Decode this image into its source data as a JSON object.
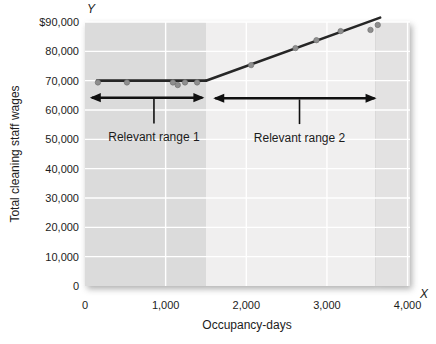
{
  "chart_data": {
    "type": "scatter",
    "title": "",
    "xlabel": "Occupancy-days",
    "ylabel": "Total cleaning staff wages",
    "x_axis_letter": "X",
    "y_axis_letter": "Y",
    "xlim": [
      0,
      4030
    ],
    "ylim": [
      0,
      90000
    ],
    "grid": true,
    "legend": "none",
    "x_ticks": [
      {
        "value": 0,
        "label": "0"
      },
      {
        "value": 1000,
        "label": "1,000"
      },
      {
        "value": 2000,
        "label": "2,000"
      },
      {
        "value": 3000,
        "label": "3,000"
      },
      {
        "value": 4000,
        "label": "4,000"
      }
    ],
    "y_ticks": [
      {
        "value": 0,
        "label": "0"
      },
      {
        "value": 10000,
        "label": "10,000"
      },
      {
        "value": 20000,
        "label": "20,000"
      },
      {
        "value": 30000,
        "label": "30,000"
      },
      {
        "value": 40000,
        "label": "40,000"
      },
      {
        "value": 50000,
        "label": "50,000"
      },
      {
        "value": 60000,
        "label": "60,000"
      },
      {
        "value": 70000,
        "label": "70,000"
      },
      {
        "value": 80000,
        "label": "80,000"
      },
      {
        "value": 90000,
        "label": "$90,000"
      }
    ],
    "background_bands": [
      {
        "name": "relevant-range-1-band",
        "x_from": 0,
        "x_to": 1500,
        "color": "#dbdbdb"
      },
      {
        "name": "relevant-range-2-band",
        "x_from": 1500,
        "x_to": 3600,
        "color": "#f0efef"
      },
      {
        "name": "beyond-data-band",
        "x_from": 3600,
        "x_to": 4030,
        "color": "#e3e2e2"
      }
    ],
    "cost_lines": [
      {
        "name": "fixed-segment",
        "points": [
          [
            150,
            70000
          ],
          [
            1500,
            70000
          ]
        ]
      },
      {
        "name": "variable-segment",
        "points": [
          [
            1500,
            70000
          ],
          [
            3660,
            91500
          ]
        ]
      }
    ],
    "observations": [
      [
        160,
        69400
      ],
      [
        520,
        69400
      ],
      [
        1090,
        69400
      ],
      [
        1150,
        68500
      ],
      [
        1240,
        69400
      ],
      [
        1390,
        69400
      ],
      [
        2060,
        75300
      ],
      [
        2610,
        81100
      ],
      [
        2870,
        83800
      ],
      [
        3170,
        86900
      ],
      [
        3540,
        87300
      ],
      [
        3630,
        89000
      ]
    ],
    "range_annotations": [
      {
        "label": "Relevant range 1",
        "x_from": 60,
        "x_to": 1480,
        "y": 64200,
        "stem_x": 855,
        "stem_bottom_y": 55400,
        "label_y": 50800
      },
      {
        "label": "Relevant range 2",
        "x_from": 1590,
        "x_to": 3615,
        "y": 64000,
        "stem_x": 2660,
        "stem_bottom_y": 55200,
        "label_y": 50500
      }
    ],
    "colors": {
      "band_range1": "#dbdbdb",
      "band_range2": "#f0efef",
      "band_beyond": "#e3e2e2",
      "gridline": "#ffffff",
      "cost_line": "#262626",
      "point_fill": "#8e8e8e",
      "point_stroke": "#737373",
      "text": "#1c1c1c",
      "arrow": "#101010"
    }
  }
}
